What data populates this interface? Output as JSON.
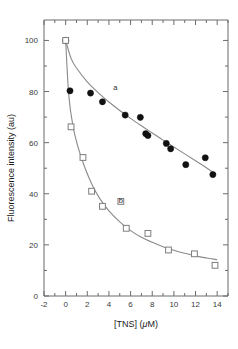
{
  "chart_data": {
    "type": "scatter",
    "title": "",
    "xlabel": "[TNS] (μM)",
    "ylabel": "Fluorescence intensity (au)",
    "xlim": [
      -2,
      15
    ],
    "ylim": [
      0,
      108
    ],
    "grid": false,
    "legend_position": "inline-curve-labels",
    "x_ticks": [
      -2,
      0,
      2,
      4,
      6,
      8,
      10,
      12,
      14
    ],
    "x_tick_labels": [
      "-2",
      "0",
      "2",
      "4",
      "6",
      "8",
      "10",
      "12",
      "14"
    ],
    "x_minor_tick_step": 1,
    "y_ticks": [
      0,
      20,
      40,
      60,
      80,
      100
    ],
    "y_tick_labels": [
      "0",
      "20",
      "40",
      "60",
      "80",
      "100"
    ],
    "y_minor_tick_step": 10,
    "series": [
      {
        "name": "a",
        "label": "a",
        "marker": "filled-circle",
        "marker_color": "#111111",
        "label_x": 4.6,
        "label_y": 80.5,
        "x": [
          0.0,
          0.4,
          2.3,
          3.4,
          5.5,
          6.9,
          7.4,
          7.6,
          9.3,
          9.7,
          11.1,
          12.9,
          13.6
        ],
        "y": [
          100.0,
          80.3,
          79.4,
          76.0,
          70.8,
          69.9,
          63.5,
          62.8,
          59.7,
          57.6,
          51.4,
          54.1,
          47.5
        ],
        "fit_curve_points": [
          [
            0.0,
            100.0
          ],
          [
            0.5,
            93.0
          ],
          [
            1.0,
            89.2
          ],
          [
            2.0,
            83.8
          ],
          [
            3.0,
            79.6
          ],
          [
            4.0,
            75.9
          ],
          [
            5.0,
            72.6
          ],
          [
            6.0,
            69.5
          ],
          [
            7.0,
            66.6
          ],
          [
            8.0,
            63.8
          ],
          [
            9.0,
            61.0
          ],
          [
            10.0,
            58.3
          ],
          [
            11.0,
            55.6
          ],
          [
            12.0,
            52.9
          ],
          [
            13.0,
            50.2
          ],
          [
            13.9,
            47.6
          ]
        ]
      },
      {
        "name": "b",
        "label": "b",
        "marker": "open-square",
        "marker_color": "#7d7d7d",
        "label_x": 5.1,
        "label_y": 36.5,
        "x": [
          0.0,
          0.5,
          1.6,
          2.4,
          3.4,
          5.1,
          5.6,
          7.6,
          9.5,
          11.9,
          13.8
        ],
        "y": [
          100.0,
          66.2,
          54.2,
          41.0,
          35.1,
          37.0,
          26.5,
          24.5,
          18.0,
          16.5,
          12.0
        ],
        "fit_curve_points": [
          [
            0.0,
            100.0
          ],
          [
            0.3,
            78.0
          ],
          [
            0.7,
            66.0
          ],
          [
            1.2,
            57.5
          ],
          [
            1.8,
            50.0
          ],
          [
            2.5,
            43.0
          ],
          [
            3.2,
            37.8
          ],
          [
            4.0,
            33.3
          ],
          [
            5.0,
            29.0
          ],
          [
            6.0,
            25.6
          ],
          [
            7.0,
            23.0
          ],
          [
            8.0,
            21.0
          ],
          [
            9.0,
            19.3
          ],
          [
            10.0,
            17.9
          ],
          [
            11.0,
            16.7
          ],
          [
            12.0,
            15.7
          ],
          [
            13.0,
            14.9
          ],
          [
            14.0,
            14.2
          ]
        ]
      }
    ]
  },
  "axes": {
    "x_title_text": "[TNS] (",
    "x_title_mu": "μ",
    "x_title_tail": "M)",
    "y_title": "Fluorescence intensity (au)"
  }
}
